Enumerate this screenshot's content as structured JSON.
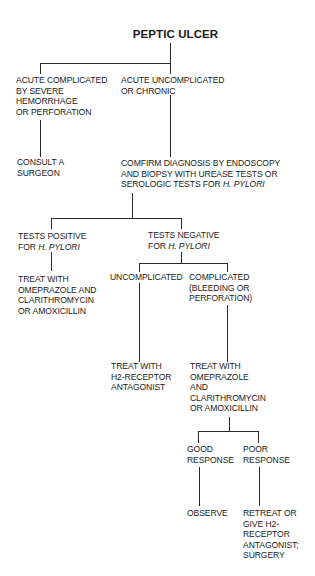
{
  "title": "PEPTIC ULCER",
  "nodes": {
    "acute_complicated": {
      "lines": [
        "ACUTE COMPLICATED",
        "BY SEVERE",
        "HEMORRHAGE",
        "OR PERFORATION"
      ]
    },
    "acute_uncomplicated": {
      "lines": [
        "ACUTE UNCOMPLICATED",
        "OR CHRONIC"
      ]
    },
    "consult_surgeon": {
      "lines": [
        "CONSULT A",
        "SURGEON"
      ]
    },
    "confirm_diagnosis": {
      "lines": [
        "COMFIRM DIAGNOSIS BY ENDOSCOPY",
        "AND BIOPSY WITH UREASE TESTS OR",
        "SEROLOGIC TESTS FOR "
      ],
      "italic_suffix": "H. PYLORI"
    },
    "tests_positive": {
      "lines": [
        "TESTS POSITIVE",
        "FOR "
      ],
      "italic_suffix": "H. PYLORI"
    },
    "tests_negative": {
      "lines": [
        "TESTS NEGATIVE",
        "FOR "
      ],
      "italic_suffix": "H. PYLORI"
    },
    "treat_positive": {
      "lines": [
        "TREAT WITH",
        "OMEPRAZOLE AND",
        "CLARITHROMYCIN",
        "OR AMOXICILLIN"
      ]
    },
    "uncomplicated": {
      "lines": [
        "UNCOMPLICATED"
      ]
    },
    "complicated": {
      "lines": [
        "COMPLICATED",
        "(BLEEDING OR",
        "PERFORATION)"
      ]
    },
    "treat_h2": {
      "lines": [
        "TREAT WITH",
        "H2-RECEPTOR",
        "ANTAGONIST"
      ]
    },
    "treat_complicated": {
      "lines": [
        "TREAT WITH",
        "OMEPRAZOLE",
        "AND",
        "CLARITHROMYCIN",
        "OR AMOXICILLIN"
      ]
    },
    "good_response": {
      "lines": [
        "GOOD",
        "RESPONSE"
      ]
    },
    "poor_response": {
      "lines": [
        "POOR",
        "RESPONSE"
      ]
    },
    "observe": {
      "lines": [
        "OBSERVE"
      ]
    },
    "retreat": {
      "lines": [
        "RETREAT OR",
        "GIVE H2-",
        "RECEPTOR",
        "ANTAGONIST;",
        "SURGERY"
      ]
    }
  }
}
